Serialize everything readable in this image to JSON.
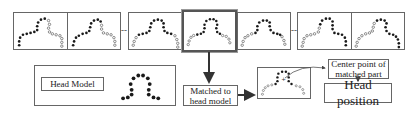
{
  "diagram": {
    "frames": [
      {
        "id": "f1",
        "highlighted": false,
        "dark_side": "left"
      },
      {
        "id": "f2",
        "highlighted": false,
        "dark_side": "left"
      },
      {
        "id": "f3",
        "highlighted": false,
        "dark_side": "center"
      },
      {
        "id": "f4",
        "highlighted": true,
        "dark_side": "center"
      },
      {
        "id": "f5",
        "highlighted": false,
        "dark_side": "center"
      },
      {
        "id": "f6",
        "highlighted": false,
        "dark_side": "right"
      },
      {
        "id": "f7",
        "highlighted": false,
        "dark_side": "right"
      }
    ],
    "separators": [
      "--",
      "--"
    ],
    "head_model": {
      "label": "Head Model"
    },
    "matched_box": {
      "line1": "Matched to",
      "line2": "head model"
    },
    "center_box": {
      "line1": "Center point of",
      "line2": "matched part"
    },
    "head_position": {
      "label": "Head position"
    },
    "colors": {
      "filled_dot": "#1a1a1a",
      "hollow_dot": "#777777",
      "border": "#666666",
      "arrow": "#333333"
    }
  }
}
